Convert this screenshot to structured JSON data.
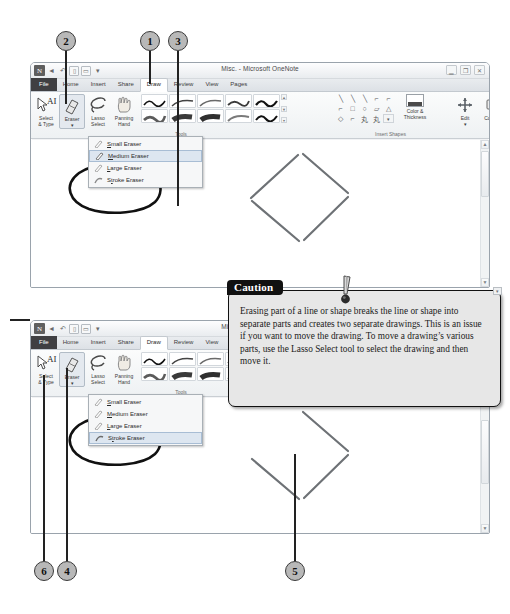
{
  "figure": {
    "callouts": [
      {
        "n": "1"
      },
      {
        "n": "2"
      },
      {
        "n": "3"
      },
      {
        "n": "4"
      },
      {
        "n": "5"
      },
      {
        "n": "6"
      }
    ]
  },
  "window": {
    "title": "Misc. - Microsoft OneNote",
    "app_icon": "N",
    "quick_access": [
      "onenote-icon",
      "back-icon",
      "undo-icon",
      "dock-icon",
      "full-page-icon",
      "customize-icon"
    ],
    "controls": [
      "minimize-icon",
      "restore-icon",
      "close-icon"
    ],
    "ribbon_controls": [
      "collapse-ribbon-icon",
      "help-icon"
    ],
    "tabs": [
      {
        "label": "File",
        "active": false,
        "file": true
      },
      {
        "label": "Home",
        "active": false
      },
      {
        "label": "Insert",
        "active": false
      },
      {
        "label": "Share",
        "active": false
      },
      {
        "label": "Draw",
        "active": true
      },
      {
        "label": "Review",
        "active": false
      },
      {
        "label": "View",
        "active": false
      },
      {
        "label": "Pages",
        "active": false
      }
    ],
    "groups": {
      "tools_label": "Tools",
      "insert_shapes_label": "Insert Shapes",
      "tools_buttons": [
        {
          "line1": "Select",
          "line2": "& Type",
          "icon": "select-and-type-icon",
          "selected": false
        },
        {
          "line1": "Eraser",
          "line2": "▾",
          "icon": "eraser-icon",
          "selected": true
        },
        {
          "line1": "Lasso",
          "line2": "Select",
          "icon": "lasso-select-icon",
          "selected": false
        },
        {
          "line1": "Panning",
          "line2": "Hand",
          "icon": "panning-hand-icon",
          "selected": false
        }
      ],
      "pen_gallery_rows": 2,
      "pen_gallery_cols": 5,
      "shapes_glyphs": [
        "\\",
        "\\",
        "\\",
        "⌐",
        "⌐",
        "⌐",
        "□",
        "○",
        "▱",
        "△",
        "◇",
        "⌐",
        "⌐",
        "⌐",
        "▪"
      ],
      "color_thickness": {
        "line1": "Color &",
        "line2": "Thickness",
        "icon": "color-and-thickness-icon"
      },
      "edit": {
        "line1": "Edit",
        "line2": "▾",
        "icon": "edit-icon"
      },
      "convert": {
        "line1": "Convert",
        "line2": "▾",
        "icon": "convert-icon"
      }
    },
    "eraser_menu": {
      "items": [
        {
          "label_pre": "",
          "label_key": "S",
          "label_post": "mall Eraser",
          "icon": "small-eraser-icon"
        },
        {
          "label_pre": "",
          "label_key": "M",
          "label_post": "edium Eraser",
          "icon": "medium-eraser-icon"
        },
        {
          "label_pre": "",
          "label_key": "L",
          "label_post": "arge Eraser",
          "icon": "large-eraser-icon"
        },
        {
          "label_pre": "S",
          "label_key": "t",
          "label_post": "roke Eraser",
          "icon": "stroke-eraser-icon"
        }
      ],
      "top_window_highlight": 1,
      "bottom_window_highlight": 3
    }
  },
  "caution": {
    "tag": "Caution",
    "icon": "exclamation-point-icon",
    "body": "Erasing part of a line or shape breaks the line or shape into separate parts and creates two separate drawings. This is an issue if you want to move the drawing. To move a drawing’s various parts, use the Lasso Select tool to select the drawing and then move it."
  },
  "colors": {
    "callout_fill": "#b8b8b8",
    "callout_border": "#3a3a3a",
    "caution_bg": "#e7e7e7",
    "caution_tag_bg": "#111111",
    "ink_black": "#111111",
    "ink_gray": "#6e7276",
    "ribbon_bg": "#f2f3f5",
    "file_tab_bg": "#3f3f42"
  }
}
